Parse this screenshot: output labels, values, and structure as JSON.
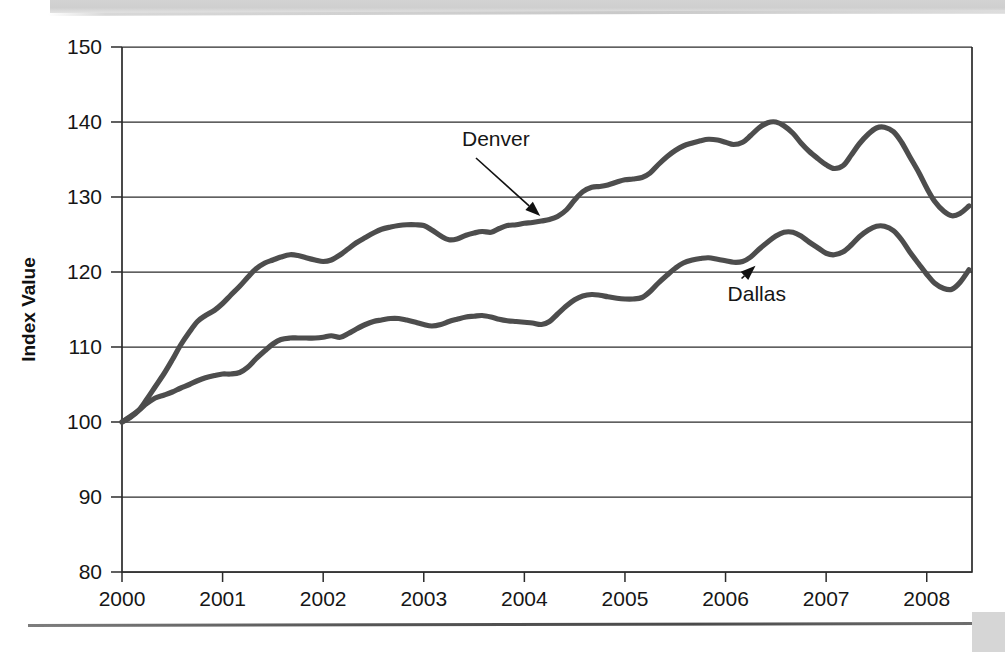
{
  "page": {
    "background_color": "#ffffff",
    "top_band_color": "#d3d3d3",
    "rule_color": "#4a4a4a",
    "corner_block_color": "#d6d6d6"
  },
  "chart_data": {
    "type": "line",
    "title": "",
    "subtitle": "",
    "xlabel": "",
    "ylabel": "Index Value",
    "xlim": [
      2000.0,
      2008.45
    ],
    "ylim": [
      80,
      150
    ],
    "y_ticks": [
      80,
      90,
      100,
      110,
      120,
      130,
      140,
      150
    ],
    "x_ticks": [
      2000,
      2001,
      2002,
      2003,
      2004,
      2005,
      2006,
      2007,
      2008
    ],
    "x_tick_labels": [
      "2000",
      "2001",
      "2002",
      "2003",
      "2004",
      "2005",
      "2006",
      "2007",
      "2008"
    ],
    "y_tick_labels": [
      "80",
      "90",
      "100",
      "110",
      "120",
      "130",
      "140",
      "150"
    ],
    "grid": true,
    "grid_axis": "y",
    "legend": "annotations",
    "legend_position": "inline-callouts",
    "line_color": "#4d4d4d",
    "series": [
      {
        "name": "Denver",
        "color": "#4d4d4d",
        "x": [
          2000.0,
          2000.08,
          2000.17,
          2000.25,
          2000.33,
          2000.42,
          2000.5,
          2000.58,
          2000.67,
          2000.75,
          2000.83,
          2000.92,
          2001.0,
          2001.08,
          2001.17,
          2001.25,
          2001.33,
          2001.42,
          2001.5,
          2001.58,
          2001.67,
          2001.75,
          2001.83,
          2001.92,
          2002.0,
          2002.08,
          2002.17,
          2002.25,
          2002.33,
          2002.42,
          2002.5,
          2002.58,
          2002.67,
          2002.75,
          2002.83,
          2002.92,
          2003.0,
          2003.08,
          2003.17,
          2003.25,
          2003.33,
          2003.42,
          2003.5,
          2003.58,
          2003.67,
          2003.75,
          2003.83,
          2003.92,
          2004.0,
          2004.08,
          2004.17,
          2004.25,
          2004.33,
          2004.42,
          2004.5,
          2004.58,
          2004.67,
          2004.75,
          2004.83,
          2004.92,
          2005.0,
          2005.08,
          2005.17,
          2005.25,
          2005.33,
          2005.42,
          2005.5,
          2005.58,
          2005.67,
          2005.75,
          2005.83,
          2005.92,
          2006.0,
          2006.08,
          2006.17,
          2006.25,
          2006.33,
          2006.42,
          2006.5,
          2006.58,
          2006.67,
          2006.75,
          2006.83,
          2006.92,
          2007.0,
          2007.08,
          2007.17,
          2007.25,
          2007.33,
          2007.42,
          2007.5,
          2007.58,
          2007.67,
          2007.75,
          2007.83,
          2007.92,
          2008.0,
          2008.08,
          2008.17,
          2008.25,
          2008.33,
          2008.42
        ],
        "values": [
          100.0,
          100.6,
          101.6,
          103.1,
          104.7,
          106.5,
          108.3,
          110.2,
          112.0,
          113.4,
          114.2,
          114.9,
          115.8,
          116.9,
          118.1,
          119.3,
          120.4,
          121.2,
          121.6,
          122.0,
          122.3,
          122.2,
          121.9,
          121.6,
          121.4,
          121.6,
          122.3,
          123.1,
          123.9,
          124.6,
          125.2,
          125.7,
          126.0,
          126.2,
          126.3,
          126.3,
          126.2,
          125.6,
          124.8,
          124.3,
          124.4,
          124.9,
          125.2,
          125.4,
          125.3,
          125.8,
          126.2,
          126.3,
          126.5,
          126.6,
          126.8,
          127.0,
          127.4,
          128.3,
          129.6,
          130.7,
          131.3,
          131.4,
          131.6,
          132.0,
          132.3,
          132.4,
          132.6,
          133.2,
          134.3,
          135.4,
          136.2,
          136.8,
          137.2,
          137.5,
          137.7,
          137.6,
          137.3,
          137.0,
          137.3,
          138.2,
          139.2,
          139.9,
          140.0,
          139.5,
          138.5,
          137.2,
          136.1,
          135.1,
          134.3,
          133.8,
          134.2,
          135.6,
          137.1,
          138.4,
          139.2,
          139.3,
          138.7,
          137.3,
          135.4,
          133.3,
          131.2,
          129.4,
          128.1,
          127.5,
          127.8,
          128.8
        ]
      },
      {
        "name": "Dallas",
        "color": "#4d4d4d",
        "x": [
          2000.0,
          2000.08,
          2000.17,
          2000.25,
          2000.33,
          2000.42,
          2000.5,
          2000.58,
          2000.67,
          2000.75,
          2000.83,
          2000.92,
          2001.0,
          2001.08,
          2001.17,
          2001.25,
          2001.33,
          2001.42,
          2001.5,
          2001.58,
          2001.67,
          2001.75,
          2001.83,
          2001.92,
          2002.0,
          2002.08,
          2002.17,
          2002.25,
          2002.33,
          2002.42,
          2002.5,
          2002.58,
          2002.67,
          2002.75,
          2002.83,
          2002.92,
          2003.0,
          2003.08,
          2003.17,
          2003.25,
          2003.33,
          2003.42,
          2003.5,
          2003.58,
          2003.67,
          2003.75,
          2003.83,
          2003.92,
          2004.0,
          2004.08,
          2004.17,
          2004.25,
          2004.33,
          2004.42,
          2004.5,
          2004.58,
          2004.67,
          2004.75,
          2004.83,
          2004.92,
          2005.0,
          2005.08,
          2005.17,
          2005.25,
          2005.33,
          2005.42,
          2005.5,
          2005.58,
          2005.67,
          2005.75,
          2005.83,
          2005.92,
          2006.0,
          2006.08,
          2006.17,
          2006.25,
          2006.33,
          2006.42,
          2006.5,
          2006.58,
          2006.67,
          2006.75,
          2006.83,
          2006.92,
          2007.0,
          2007.08,
          2007.17,
          2007.25,
          2007.33,
          2007.42,
          2007.5,
          2007.58,
          2007.67,
          2007.75,
          2007.83,
          2007.92,
          2008.0,
          2008.08,
          2008.17,
          2008.25,
          2008.33,
          2008.42
        ],
        "values": [
          100.0,
          100.7,
          101.6,
          102.5,
          103.2,
          103.6,
          104.0,
          104.5,
          105.0,
          105.5,
          105.9,
          106.2,
          106.4,
          106.4,
          106.6,
          107.3,
          108.4,
          109.5,
          110.4,
          111.0,
          111.2,
          111.2,
          111.2,
          111.2,
          111.3,
          111.5,
          111.3,
          111.8,
          112.4,
          113.0,
          113.4,
          113.6,
          113.8,
          113.8,
          113.6,
          113.3,
          113.0,
          112.8,
          113.0,
          113.4,
          113.7,
          114.0,
          114.1,
          114.2,
          114.0,
          113.7,
          113.5,
          113.4,
          113.3,
          113.2,
          113.0,
          113.4,
          114.4,
          115.5,
          116.3,
          116.8,
          117.0,
          116.9,
          116.7,
          116.5,
          116.4,
          116.4,
          116.6,
          117.4,
          118.5,
          119.6,
          120.5,
          121.2,
          121.6,
          121.8,
          121.9,
          121.7,
          121.5,
          121.3,
          121.4,
          122.0,
          123.0,
          124.0,
          124.8,
          125.3,
          125.3,
          124.8,
          124.0,
          123.2,
          122.5,
          122.3,
          122.7,
          123.6,
          124.7,
          125.6,
          126.1,
          126.1,
          125.5,
          124.3,
          122.7,
          121.1,
          119.7,
          118.5,
          117.8,
          117.7,
          118.6,
          120.3
        ]
      }
    ],
    "annotations": [
      {
        "label": "Denver",
        "label_x": 2003.38,
        "label_y": 136.8,
        "point_x": 2004.18,
        "point_y": 127.2
      },
      {
        "label": "Dallas",
        "label_x": 2006.02,
        "label_y": 116.2,
        "point_x": 2006.32,
        "point_y": 121.1
      }
    ]
  }
}
